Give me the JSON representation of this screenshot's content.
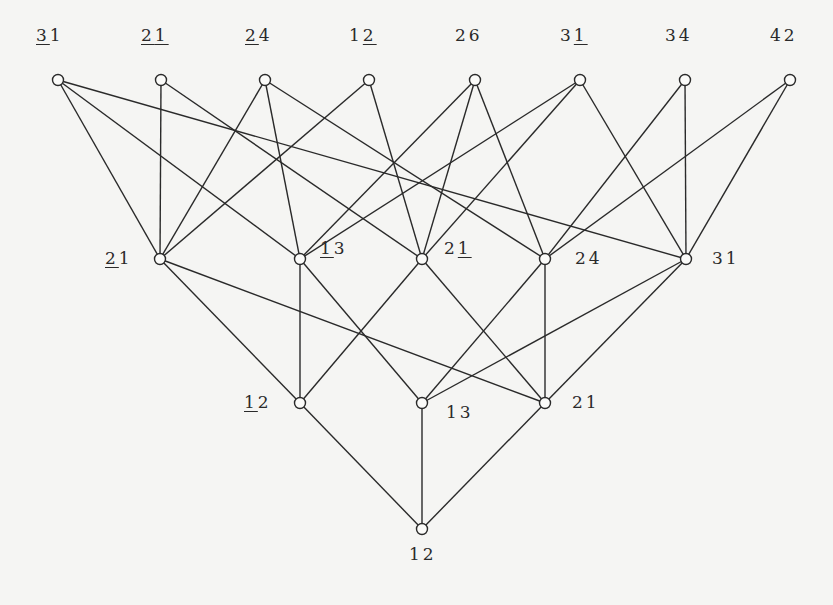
{
  "diagram": {
    "type": "hasse-diagram",
    "nodes": [
      {
        "id": "t1",
        "x": 58,
        "y": 80,
        "label": [
          {
            "ch": "3",
            "u": true
          },
          {
            "ch": "1",
            "u": false
          }
        ],
        "lx": 36,
        "ly": 36
      },
      {
        "id": "t2",
        "x": 161,
        "y": 80,
        "label": [
          {
            "ch": "2",
            "u": true
          },
          {
            "ch": "1",
            "u": true
          }
        ],
        "lx": 141,
        "ly": 36
      },
      {
        "id": "t3",
        "x": 265,
        "y": 80,
        "label": [
          {
            "ch": "2",
            "u": true
          },
          {
            "ch": "4",
            "u": false
          }
        ],
        "lx": 245,
        "ly": 36
      },
      {
        "id": "t4",
        "x": 369,
        "y": 80,
        "label": [
          {
            "ch": "1",
            "u": false
          },
          {
            "ch": "2",
            "u": true
          }
        ],
        "lx": 349,
        "ly": 36
      },
      {
        "id": "t5",
        "x": 475,
        "y": 80,
        "label": [
          {
            "ch": "2",
            "u": false
          },
          {
            "ch": "6",
            "u": false
          }
        ],
        "lx": 455,
        "ly": 36
      },
      {
        "id": "t6",
        "x": 580,
        "y": 80,
        "label": [
          {
            "ch": "3",
            "u": false
          },
          {
            "ch": "1",
            "u": true
          }
        ],
        "lx": 560,
        "ly": 36
      },
      {
        "id": "t7",
        "x": 685,
        "y": 80,
        "label": [
          {
            "ch": "3",
            "u": false
          },
          {
            "ch": "4",
            "u": false
          }
        ],
        "lx": 665,
        "ly": 36
      },
      {
        "id": "t8",
        "x": 790,
        "y": 80,
        "label": [
          {
            "ch": "4",
            "u": false
          },
          {
            "ch": "2",
            "u": false
          }
        ],
        "lx": 770,
        "ly": 36
      },
      {
        "id": "m1",
        "x": 160,
        "y": 259,
        "label": [
          {
            "ch": "2",
            "u": true
          },
          {
            "ch": "1",
            "u": false
          }
        ],
        "lx": 105,
        "ly": 259
      },
      {
        "id": "m2",
        "x": 300,
        "y": 259,
        "label": [
          {
            "ch": "1",
            "u": true
          },
          {
            "ch": "3",
            "u": false
          }
        ],
        "lx": 320,
        "ly": 249
      },
      {
        "id": "m3",
        "x": 422,
        "y": 259,
        "label": [
          {
            "ch": "2",
            "u": false
          },
          {
            "ch": "1",
            "u": true
          }
        ],
        "lx": 444,
        "ly": 249
      },
      {
        "id": "m4",
        "x": 545,
        "y": 259,
        "label": [
          {
            "ch": "2",
            "u": false
          },
          {
            "ch": "4",
            "u": false
          }
        ],
        "lx": 575,
        "ly": 259
      },
      {
        "id": "m5",
        "x": 686,
        "y": 259,
        "label": [
          {
            "ch": "3",
            "u": false
          },
          {
            "ch": "1",
            "u": false
          }
        ],
        "lx": 712,
        "ly": 259
      },
      {
        "id": "b1",
        "x": 300,
        "y": 403,
        "label": [
          {
            "ch": "1",
            "u": true
          },
          {
            "ch": "2",
            "u": false
          }
        ],
        "lx": 244,
        "ly": 403
      },
      {
        "id": "b2",
        "x": 422,
        "y": 403,
        "label": [
          {
            "ch": "1",
            "u": false
          },
          {
            "ch": "3",
            "u": false
          }
        ],
        "lx": 446,
        "ly": 413
      },
      {
        "id": "b3",
        "x": 545,
        "y": 403,
        "label": [
          {
            "ch": "2",
            "u": false
          },
          {
            "ch": "1",
            "u": false
          }
        ],
        "lx": 572,
        "ly": 403
      },
      {
        "id": "b0",
        "x": 422,
        "y": 529,
        "label": [
          {
            "ch": "1",
            "u": false
          },
          {
            "ch": "2",
            "u": false
          }
        ],
        "lx": 409,
        "ly": 555
      }
    ],
    "edges": [
      [
        "t1",
        "m1"
      ],
      [
        "t1",
        "m2"
      ],
      [
        "t1",
        "m5"
      ],
      [
        "t2",
        "m1"
      ],
      [
        "t2",
        "m3"
      ],
      [
        "t3",
        "m1"
      ],
      [
        "t3",
        "m2"
      ],
      [
        "t3",
        "m4"
      ],
      [
        "t4",
        "m1"
      ],
      [
        "t4",
        "m3"
      ],
      [
        "t5",
        "m2"
      ],
      [
        "t5",
        "m3"
      ],
      [
        "t5",
        "m4"
      ],
      [
        "t6",
        "m2"
      ],
      [
        "t6",
        "m3"
      ],
      [
        "t6",
        "m5"
      ],
      [
        "t7",
        "m4"
      ],
      [
        "t7",
        "m5"
      ],
      [
        "t8",
        "m4"
      ],
      [
        "t8",
        "m5"
      ],
      [
        "m1",
        "b1"
      ],
      [
        "m1",
        "b3"
      ],
      [
        "m2",
        "b1"
      ],
      [
        "m2",
        "b2"
      ],
      [
        "m3",
        "b1"
      ],
      [
        "m3",
        "b3"
      ],
      [
        "m4",
        "b2"
      ],
      [
        "m4",
        "b3"
      ],
      [
        "m5",
        "b2"
      ],
      [
        "m5",
        "b3"
      ],
      [
        "b1",
        "b0"
      ],
      [
        "b2",
        "b0"
      ],
      [
        "b3",
        "b0"
      ]
    ]
  }
}
